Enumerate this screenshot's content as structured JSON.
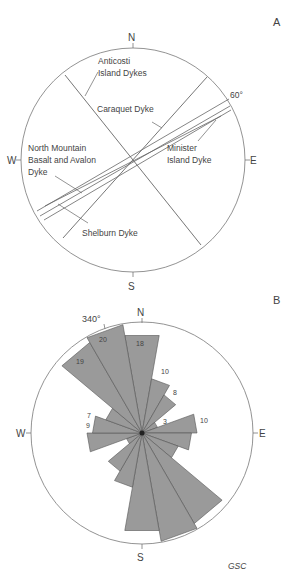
{
  "panel_a": {
    "label": "A",
    "compass": {
      "n": "N",
      "s": "S",
      "e": "E",
      "w": "W"
    },
    "angle_label": "60°",
    "dykes": [
      {
        "name": "Anticosti Island Dykes",
        "line1": "Anticosti",
        "line2": "Island Dykes",
        "azimuth": 325
      },
      {
        "name": "Caraquet Dyke",
        "line1": "Caraquet Dyke",
        "azimuth": 40
      },
      {
        "name": "Minister Island Dyke",
        "line1": "Minister",
        "line2": "Island Dyke",
        "azimuth": 60
      },
      {
        "name": "North Mountain Basalt and Avalon Dyke",
        "line1": "North Mountain",
        "line2": "Basalt and Avalon",
        "line3": "Dyke",
        "azimuth": 63
      },
      {
        "name": "Shelburn Dyke",
        "line1": "Shelburn Dyke",
        "azimuth": 65
      }
    ]
  },
  "panel_b": {
    "label": "B",
    "compass": {
      "n": "N",
      "s": "S",
      "e": "E",
      "w": "W"
    },
    "angle_label": "340°",
    "credit": "GSC"
  },
  "chart_data": [
    {
      "type": "diagram",
      "title": "A",
      "description": "Stereographic/compass diagram of dyke trends",
      "lines": [
        {
          "label": "Anticosti Island Dykes",
          "trend_deg": 325
        },
        {
          "label": "Caraquet Dyke",
          "trend_deg": 40
        },
        {
          "label": "Minister Island Dyke",
          "trend_deg": 58
        },
        {
          "label": "Minister Island Dyke",
          "trend_deg": 61
        },
        {
          "label": "North Mountain Basalt and Avalon Dyke",
          "trend_deg": 63
        },
        {
          "label": "Shelburn Dyke",
          "trend_deg": 65
        }
      ],
      "annotations": [
        "60°"
      ]
    },
    {
      "type": "rose",
      "title": "B",
      "bin_width_deg": 20,
      "bins": [
        {
          "from": 350,
          "to": 10,
          "count": 18
        },
        {
          "from": 10,
          "to": 30,
          "count": 10
        },
        {
          "from": 30,
          "to": 50,
          "count": 8
        },
        {
          "from": 50,
          "to": 70,
          "count": 3
        },
        {
          "from": 70,
          "to": 90,
          "count": 10
        },
        {
          "from": 90,
          "to": 110,
          "count": 9
        },
        {
          "from": 110,
          "to": 130,
          "count": 7
        },
        {
          "from": 130,
          "to": 150,
          "count": 19
        },
        {
          "from": 150,
          "to": 170,
          "count": 20
        },
        {
          "from": 170,
          "to": 190,
          "count": 18
        },
        {
          "from": 190,
          "to": 210,
          "count": 10
        },
        {
          "from": 210,
          "to": 230,
          "count": 8
        },
        {
          "from": 230,
          "to": 250,
          "count": 3
        },
        {
          "from": 250,
          "to": 270,
          "count": 10
        },
        {
          "from": 270,
          "to": 290,
          "count": 9
        },
        {
          "from": 290,
          "to": 310,
          "count": 7
        },
        {
          "from": 310,
          "to": 330,
          "count": 19
        },
        {
          "from": 330,
          "to": 350,
          "count": 20
        }
      ],
      "visible_count_labels": [
        20,
        19,
        18,
        10,
        8,
        3,
        10,
        9,
        7
      ],
      "annotations": [
        "340°",
        "GSC"
      ]
    }
  ]
}
